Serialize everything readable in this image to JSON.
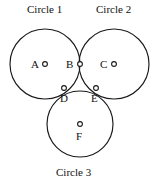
{
  "figure": {
    "background_color": "#ffffff",
    "stroke_color": "#1a1a1a",
    "titles": {
      "circle1": "Circle 1",
      "circle2": "Circle 2",
      "circle3": "Circle 3"
    },
    "points": {
      "A": "A",
      "B": "B",
      "C": "C",
      "D": "D",
      "E": "E",
      "F": "F"
    }
  },
  "chart_data": {
    "type": "diagram",
    "shapes": [
      {
        "name": "Circle 1",
        "kind": "circle",
        "cx": 45,
        "cy": 64,
        "r": 35
      },
      {
        "name": "Circle 2",
        "kind": "circle",
        "cx": 114,
        "cy": 64,
        "r": 35
      },
      {
        "name": "Circle 3",
        "kind": "circle",
        "cx": 80,
        "cy": 124,
        "r": 33
      }
    ],
    "labeled_points": [
      {
        "label": "A",
        "x": 45,
        "y": 64,
        "role": "center of Circle 1"
      },
      {
        "label": "B",
        "x": 80,
        "y": 64,
        "role": "tangency of Circle 1 and Circle 2"
      },
      {
        "label": "C",
        "x": 114,
        "y": 64,
        "role": "center of Circle 2"
      },
      {
        "label": "D",
        "x": 64,
        "y": 88,
        "role": "tangency of Circle 1 and Circle 3"
      },
      {
        "label": "E",
        "x": 96,
        "y": 88,
        "role": "tangency of Circle 2 and Circle 3"
      },
      {
        "label": "F",
        "x": 80,
        "y": 124,
        "role": "center of Circle 3"
      }
    ],
    "marker_radius": 2.4,
    "grid": false,
    "legend": null
  }
}
